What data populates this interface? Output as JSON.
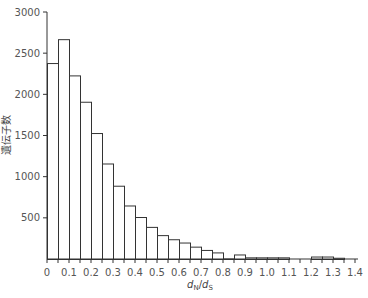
{
  "chart_data": {
    "type": "bar",
    "subtype": "histogram",
    "title": "",
    "xlabel": "dN/dS",
    "xlabel_parts": {
      "main": "d",
      "sub1": "N",
      "sep": "/",
      "main2": "d",
      "sub2": "S"
    },
    "ylabel": "遺伝子数",
    "xlim": [
      0,
      1.4
    ],
    "ylim": [
      0,
      3000
    ],
    "bin_width": 0.05,
    "grid": false,
    "legend": null,
    "x_ticks": [
      "0",
      "0.1",
      "0.2",
      "0.3",
      "0.4",
      "0.5",
      "0.6",
      "0.7",
      "0.8",
      "0.9",
      "1.0",
      "1.1",
      "1.2",
      "1.3",
      "1.4"
    ],
    "y_ticks": [
      "500",
      "1000",
      "1500",
      "2000",
      "2500",
      "3000"
    ],
    "categories": [
      "0-0.05",
      "0.05-0.1",
      "0.1-0.15",
      "0.15-0.2",
      "0.2-0.25",
      "0.25-0.3",
      "0.3-0.35",
      "0.35-0.4",
      "0.4-0.45",
      "0.45-0.5",
      "0.5-0.55",
      "0.55-0.6",
      "0.6-0.65",
      "0.65-0.7",
      "0.7-0.75",
      "0.75-0.8",
      "0.8-0.85",
      "0.85-0.9",
      "0.9-0.95",
      "0.95-1.0",
      "1.0-1.05",
      "1.05-1.1",
      "1.1-1.15",
      "1.15-1.2",
      "1.2-1.25",
      "1.25-1.3",
      "1.3-1.35",
      "1.35-1.4"
    ],
    "bin_starts": [
      0,
      0.05,
      0.1,
      0.15,
      0.2,
      0.25,
      0.3,
      0.35,
      0.4,
      0.45,
      0.5,
      0.55,
      0.6,
      0.65,
      0.7,
      0.75,
      0.8,
      0.85,
      0.9,
      0.95,
      1.0,
      1.05,
      1.1,
      1.15,
      1.2,
      1.25,
      1.3,
      1.35
    ],
    "values": [
      2380,
      2670,
      2230,
      1910,
      1530,
      1160,
      890,
      650,
      510,
      390,
      290,
      240,
      200,
      150,
      110,
      80,
      5,
      55,
      20,
      20,
      20,
      20,
      0,
      0,
      30,
      30,
      15,
      0
    ]
  }
}
